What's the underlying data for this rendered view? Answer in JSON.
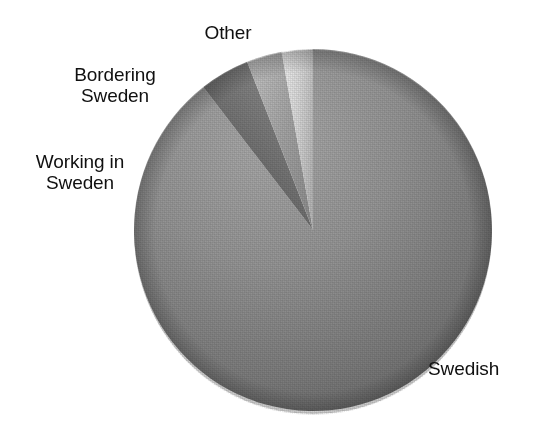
{
  "chart_data": {
    "type": "pie",
    "title": "",
    "subtitle": "",
    "xlabel": "",
    "ylabel": "",
    "legend_position": "none",
    "grid": false,
    "labels_placement": "outside-callout-free",
    "start_angle_deg": 0,
    "direction": "clockwise",
    "categories": [
      "Swedish",
      "Other",
      "Bordering Sweden",
      "Working in Sweden"
    ],
    "values": [
      89.5,
      4.5,
      3.2,
      2.8
    ],
    "units": "percent",
    "slices": [
      {
        "label": "Swedish",
        "value": 89.5,
        "start_angle_deg": 0,
        "end_angle_deg": 322.2,
        "color": "#8e8e8e",
        "color_light": "#a6a6a6",
        "color_dark": "#6b6b6b"
      },
      {
        "label": "Other",
        "value": 4.5,
        "start_angle_deg": 322.2,
        "end_angle_deg": 338.4,
        "color": "#737373",
        "color_light": "#8a8a8a",
        "color_dark": "#4e4e4e"
      },
      {
        "label": "Bordering Sweden",
        "value": 3.2,
        "start_angle_deg": 338.4,
        "end_angle_deg": 349.9,
        "color": "#a3a3a3",
        "color_light": "#bdbdbd",
        "color_dark": "#8c8c8c"
      },
      {
        "label": "Working in Sweden",
        "value": 2.8,
        "start_angle_deg": 349.9,
        "end_angle_deg": 360,
        "color": "#cfcfcf",
        "color_light": "#e6e6e6",
        "color_dark": "#b5b5b5"
      }
    ]
  },
  "labels": {
    "other": "Other",
    "bordering_sweden": "Bordering\nSweden",
    "working_in_sweden": "Working in\nSweden",
    "swedish": "Swedish"
  },
  "colors": {
    "background": "#ffffff",
    "text": "#101010",
    "slice_swedish": "#8e8e8e",
    "slice_other": "#737373",
    "slice_bordering": "#a3a3a3",
    "slice_working": "#cfcfcf"
  }
}
